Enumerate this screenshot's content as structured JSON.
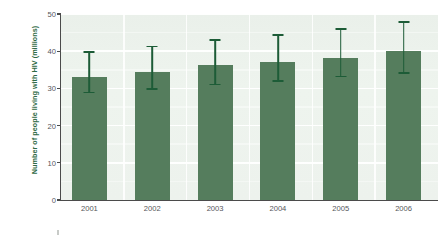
{
  "chart_data": {
    "type": "bar",
    "title": "",
    "subtitle": "",
    "xlabel": "",
    "ylabel": "Number of people living with HIV (millions)",
    "categories": [
      "2001",
      "2002",
      "2003",
      "2004",
      "2005",
      "2006"
    ],
    "values": [
      33.2,
      34.5,
      36.2,
      37.2,
      38.3,
      40.0
    ],
    "series": [
      {
        "name": "Number of people living with HIV (millions)",
        "values": [
          33.2,
          34.5,
          36.2,
          37.2,
          38.3,
          40.0
        ],
        "error_low": [
          28.9,
          29.8,
          31.0,
          32.0,
          33.2,
          34.2
        ],
        "error_high": [
          39.8,
          41.3,
          43.0,
          44.3,
          46.0,
          47.8
        ]
      }
    ],
    "ylim": [
      0,
      50
    ],
    "yticks": [
      "0",
      "10",
      "20",
      "30",
      "40",
      "50"
    ],
    "ytick_values": [
      0,
      10,
      20,
      30,
      40,
      50
    ],
    "grid": true,
    "legend": "none",
    "bar_color": "#557d5d",
    "error_bar_color": "#1d5c37",
    "plot_background": "#eef3ee",
    "axis_color": "#4b4b4b",
    "label_color": "#2f6b46",
    "tick_label_color": "#55565a"
  },
  "axis": {
    "y_title": "Number of people living with HIV (millions)",
    "y_ticks": [
      {
        "label": "50",
        "value": 50
      },
      {
        "label": "40",
        "value": 40
      },
      {
        "label": "30",
        "value": 30
      },
      {
        "label": "20",
        "value": 20
      },
      {
        "label": "10",
        "value": 10
      },
      {
        "label": "0",
        "value": 0
      }
    ],
    "x_ticks": [
      {
        "label": "2001"
      },
      {
        "label": "2002"
      },
      {
        "label": "2003"
      },
      {
        "label": "2004"
      },
      {
        "label": "2005"
      },
      {
        "label": "2006"
      }
    ]
  }
}
